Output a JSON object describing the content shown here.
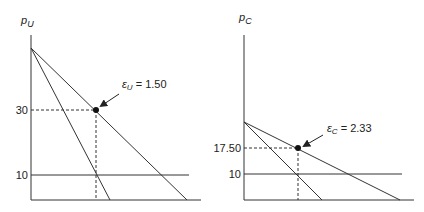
{
  "panels": [
    {
      "id": "left",
      "axis_label_main": "p",
      "axis_label_sub": "U",
      "ticks": {
        "high": "30",
        "low": "10"
      },
      "annotation": {
        "eps": "ε",
        "sub": "U",
        "value": " = 1.50"
      }
    },
    {
      "id": "right",
      "axis_label_main": "p",
      "axis_label_sub": "C",
      "ticks": {
        "high": "17.50",
        "low": "10"
      },
      "annotation": {
        "eps": "ε",
        "sub": "C",
        "value": " = 2.33"
      }
    }
  ],
  "colors": {
    "line": "#333333",
    "point": "#111111"
  }
}
